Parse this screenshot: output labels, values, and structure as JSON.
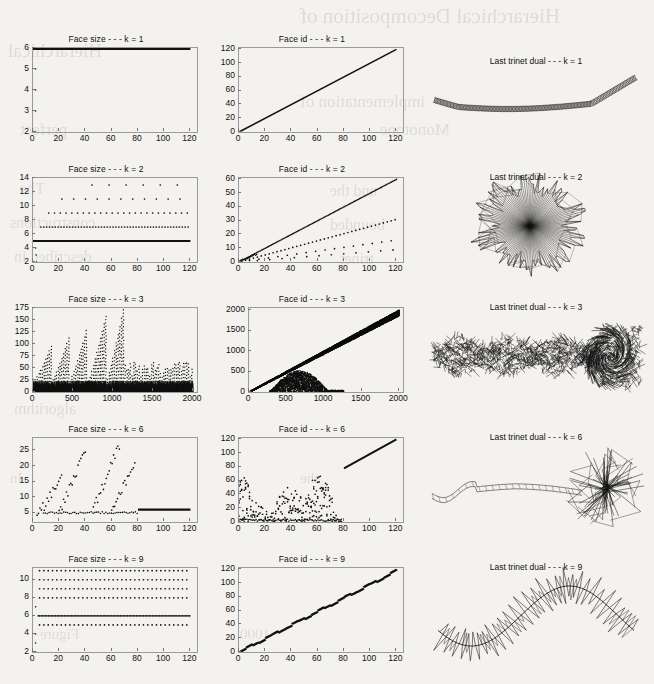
{
  "figure": {
    "background_color": "#f4f2ee",
    "ink_color": "#111111",
    "axis_color": "#9a9a9a"
  },
  "ghost_text": [
    {
      "text": "Hierarchical Decomposition of",
      "x": 300,
      "y": 4,
      "size": 21
    },
    {
      "text": "Hierarchical",
      "x": 8,
      "y": 40,
      "size": 19
    },
    {
      "text": "implementation of",
      "x": 300,
      "y": 92,
      "size": 17
    },
    {
      "text": "perfect",
      "x": 20,
      "y": 120,
      "size": 17
    },
    {
      "text": "Monotone",
      "x": 380,
      "y": 120,
      "size": 17
    },
    {
      "text": "The",
      "x": 20,
      "y": 180,
      "size": 16
    },
    {
      "text": "and the",
      "x": 330,
      "y": 182,
      "size": 16
    },
    {
      "text": "constructions",
      "x": 10,
      "y": 214,
      "size": 16
    },
    {
      "text": "bounded",
      "x": 330,
      "y": 216,
      "size": 16
    },
    {
      "text": "described in",
      "x": 14,
      "y": 248,
      "size": 16
    },
    {
      "text": "trinet",
      "x": 340,
      "y": 250,
      "size": 16
    },
    {
      "text": "algorithm",
      "x": 14,
      "y": 400,
      "size": 16
    },
    {
      "text": "In",
      "x": 10,
      "y": 470,
      "size": 15
    },
    {
      "text": "the",
      "x": 300,
      "y": 470,
      "size": 15
    },
    {
      "text": "1000",
      "x": 240,
      "y": 626,
      "size": 15
    },
    {
      "text": "Figure",
      "x": 40,
      "y": 626,
      "size": 15
    }
  ],
  "panels": [
    {
      "row": 0,
      "k": 1,
      "face_size": {
        "title": "Face size - - - k = 1",
        "yticks": [
          2,
          3,
          4,
          5,
          6
        ],
        "xticks": [
          0,
          20,
          40,
          60,
          80,
          100,
          120
        ],
        "ylim": [
          2,
          6
        ],
        "xlim": [
          0,
          125
        ],
        "ylabel": "",
        "xlabel": ""
      },
      "face_id": {
        "title": "Face id - - - k = 1",
        "yticks": [
          0,
          20,
          40,
          60,
          80,
          100,
          120
        ],
        "xticks": [
          0,
          20,
          40,
          60,
          80,
          100,
          120
        ],
        "ylim": [
          0,
          122
        ],
        "xlim": [
          0,
          125
        ],
        "ylabel": "",
        "xlabel": ""
      },
      "mesh": {
        "title": "Last trinet dual - - - k = 1",
        "shape": "smooth-strand"
      }
    },
    {
      "row": 1,
      "k": 2,
      "face_size": {
        "title": "Face size - - - k = 2",
        "yticks": [
          2,
          4,
          6,
          8,
          10,
          12,
          14
        ],
        "xticks": [
          0,
          20,
          40,
          60,
          80,
          100,
          120
        ],
        "ylim": [
          2,
          14
        ],
        "xlim": [
          0,
          125
        ],
        "ylabel": "",
        "xlabel": ""
      },
      "face_id": {
        "title": "Face id - - - k = 2",
        "yticks": [
          0,
          10,
          20,
          30,
          40,
          50,
          60
        ],
        "xticks": [
          0,
          20,
          40,
          60,
          80,
          100,
          120
        ],
        "ylim": [
          0,
          61
        ],
        "xlim": [
          0,
          125
        ],
        "ylabel": "",
        "xlabel": ""
      },
      "mesh": {
        "title": "Last trinet dual - - - k = 2",
        "shape": "radial-burst"
      }
    },
    {
      "row": 2,
      "k": 3,
      "face_size": {
        "title": "Face size - - - k = 3",
        "yticks": [
          0,
          25,
          50,
          75,
          100,
          125,
          150,
          175
        ],
        "xticks": [
          0,
          500,
          1000,
          1500,
          2000
        ],
        "ylim": [
          0,
          175
        ],
        "xlim": [
          0,
          2050
        ],
        "ylabel": "",
        "xlabel": ""
      },
      "face_id": {
        "title": "Face id - - - k = 3",
        "yticks": [
          0,
          500,
          1000,
          1500,
          2000
        ],
        "xticks": [
          0,
          500,
          1000,
          1500,
          2000
        ],
        "ylim": [
          0,
          2050
        ],
        "xlim": [
          0,
          2050
        ],
        "ylabel": "",
        "xlabel": ""
      },
      "mesh": {
        "title": "Last trinet dual - - - k = 3",
        "shape": "dense-caterpillar"
      }
    },
    {
      "row": 3,
      "k": 6,
      "face_size": {
        "title": "Face size - - - k = 6",
        "yticks": [
          5,
          10,
          15,
          20,
          25
        ],
        "xticks": [
          0,
          20,
          40,
          60,
          80,
          100,
          120
        ],
        "ylim": [
          2,
          29
        ],
        "xlim": [
          0,
          125
        ],
        "ylabel": "",
        "xlabel": ""
      },
      "face_id": {
        "title": "Face id - - - k = 6",
        "yticks": [
          0,
          20,
          40,
          60,
          80,
          100,
          120
        ],
        "xticks": [
          0,
          20,
          40,
          60,
          80,
          100,
          120
        ],
        "ylim": [
          0,
          122
        ],
        "xlim": [
          0,
          125
        ],
        "ylabel": "",
        "xlabel": ""
      },
      "mesh": {
        "title": "Last trinet dual - - - k = 6",
        "shape": "tadpole-burst"
      }
    },
    {
      "row": 4,
      "k": 9,
      "face_size": {
        "title": "Face size - - - k = 9",
        "yticks": [
          2,
          4,
          6,
          8,
          10
        ],
        "xticks": [
          0,
          20,
          40,
          60,
          80,
          100,
          120
        ],
        "ylim": [
          2,
          11.3
        ],
        "xlim": [
          0,
          125
        ],
        "ylabel": "",
        "xlabel": ""
      },
      "face_id": {
        "title": "Face id - - - k = 9",
        "yticks": [
          0,
          20,
          40,
          60,
          80,
          100,
          120
        ],
        "xticks": [
          0,
          20,
          40,
          60,
          80,
          100,
          120
        ],
        "ylim": [
          0,
          122
        ],
        "xlim": [
          0,
          125
        ],
        "ylabel": "",
        "xlabel": ""
      },
      "mesh": {
        "title": "Last trinet dual - - - k = 9",
        "shape": "spiky-sine"
      }
    }
  ],
  "chart_data": [
    {
      "type": "scatter",
      "title": "Face size - - - k = 1",
      "xlabel": "",
      "ylabel": "",
      "xlim": [
        0,
        125
      ],
      "ylim": [
        2,
        6
      ],
      "xticks": [
        0,
        20,
        40,
        60,
        80,
        100,
        120
      ],
      "yticks": [
        2,
        3,
        4,
        5,
        6
      ],
      "grid": false,
      "legend": null,
      "note": "Dense horizontal band of points at y = 6 for x from 0 to 120; a short vertical column of isolated points near x = 2 at y = 2, 3, 4, 5.",
      "series": [
        {
          "name": "plateau",
          "x": [
            0,
            120
          ],
          "y": [
            6,
            6
          ]
        },
        {
          "name": "startup",
          "x": [
            2,
            2,
            2,
            2
          ],
          "y": [
            2,
            3,
            4,
            5
          ]
        }
      ]
    },
    {
      "type": "scatter",
      "title": "Face id - - - k = 1",
      "xlabel": "",
      "ylabel": "",
      "xlim": [
        0,
        125
      ],
      "ylim": [
        0,
        122
      ],
      "xticks": [
        0,
        20,
        40,
        60,
        80,
        100,
        120
      ],
      "yticks": [
        0,
        20,
        40,
        60,
        80,
        100,
        120
      ],
      "grid": false,
      "legend": null,
      "note": "Single straight diagonal line of points from (0,0) to (120,120); identity relation.",
      "series": [
        {
          "name": "identity",
          "x": [
            0,
            120
          ],
          "y": [
            0,
            120
          ]
        }
      ]
    },
    {
      "type": "scatter",
      "title": "Face size - - - k = 2",
      "xlabel": "",
      "ylabel": "",
      "xlim": [
        0,
        125
      ],
      "ylim": [
        2,
        14
      ],
      "xticks": [
        0,
        20,
        40,
        60,
        80,
        100,
        120
      ],
      "yticks": [
        2,
        4,
        6,
        8,
        10,
        12,
        14
      ],
      "grid": false,
      "legend": null,
      "note": "Solid line at y = 5; dotted rows at y = 7 and y = 9 spanning full x; sparser dots at y = 11 and y = 13; short startup column near x = 2 at y = 2..4.",
      "series": [
        {
          "name": "y=5 solid",
          "x": [
            0,
            120
          ],
          "y": [
            5,
            5
          ]
        },
        {
          "name": "y=7 dotted",
          "x": [
            6,
            120
          ],
          "y": [
            7,
            7
          ]
        },
        {
          "name": "y=9 dotted",
          "x": [
            12,
            120
          ],
          "y": [
            9,
            9
          ]
        },
        {
          "name": "y=11 sparse",
          "x": [
            22,
            120
          ],
          "y": [
            11,
            11
          ]
        },
        {
          "name": "y=13 sparse",
          "x": [
            45,
            120
          ],
          "y": [
            13,
            13
          ]
        }
      ]
    },
    {
      "type": "scatter",
      "title": "Face id - - - k = 2",
      "xlabel": "",
      "ylabel": "",
      "xlim": [
        0,
        125
      ],
      "ylim": [
        0,
        61
      ],
      "xticks": [
        0,
        20,
        40,
        60,
        80,
        100,
        120
      ],
      "yticks": [
        0,
        10,
        20,
        30,
        40,
        50,
        60
      ],
      "grid": false,
      "legend": null,
      "note": "Main dense diagonal of slope 0.5 from (0,0) to (120,60); secondary dotted ray of slope ~0.26; two fainter lower scatters of slope ~0.13 and ~0.08.",
      "series": [
        {
          "name": "ray-1",
          "x": [
            0,
            120
          ],
          "y": [
            0,
            60
          ]
        },
        {
          "name": "ray-2",
          "x": [
            0,
            120
          ],
          "y": [
            0,
            31
          ]
        },
        {
          "name": "ray-3",
          "x": [
            0,
            120
          ],
          "y": [
            0,
            16
          ]
        },
        {
          "name": "ray-4",
          "x": [
            0,
            120
          ],
          "y": [
            0,
            9
          ]
        }
      ]
    },
    {
      "type": "scatter",
      "title": "Face size - - - k = 3",
      "xlabel": "",
      "ylabel": "",
      "xlim": [
        0,
        2050
      ],
      "ylim": [
        0,
        175
      ],
      "xticks": [
        0,
        500,
        1000,
        1500,
        2000
      ],
      "yticks": [
        0,
        25,
        50,
        75,
        100,
        125,
        150,
        175
      ],
      "grid": false,
      "legend": null,
      "note": "Dense black mass below y = 25 across all x; repeating sawtooth spikes; a few tall ramps reaching 150-175 near x = 250-1150; spike envelope drops to ~60 after x = 1200.",
      "series": [
        {
          "name": "baseline-mass",
          "x": [
            0,
            2000
          ],
          "y": [
            0,
            25
          ]
        },
        {
          "name": "tall-ramps-peak",
          "x": [
            250,
            500,
            700,
            900,
            1100
          ],
          "y": [
            80,
            110,
            135,
            160,
            172
          ]
        },
        {
          "name": "late-spikes-peak",
          "x": [
            1200,
            1500,
            1800,
            2000
          ],
          "y": [
            58,
            58,
            60,
            58
          ]
        }
      ]
    },
    {
      "type": "scatter",
      "title": "Face id - - - k = 3",
      "xlabel": "",
      "ylabel": "",
      "xlim": [
        0,
        2050
      ],
      "ylim": [
        0,
        2050
      ],
      "xticks": [
        0,
        500,
        1000,
        1500,
        2000
      ],
      "yticks": [
        0,
        500,
        1000,
        1500,
        2000
      ],
      "grid": false,
      "legend": null,
      "note": "Thick jagged diagonal band from (0,0) to (2000,2000) widening at the top; a dense low cluster below y = 500 for x between 300 and 1250.",
      "series": [
        {
          "name": "main-diagonal",
          "x": [
            0,
            2000
          ],
          "y": [
            0,
            2000
          ]
        },
        {
          "name": "low-cluster",
          "x": [
            300,
            1250
          ],
          "y": [
            0,
            500
          ]
        }
      ]
    },
    {
      "type": "scatter",
      "title": "Face size - - - k = 6",
      "xlabel": "",
      "ylabel": "",
      "xlim": [
        0,
        125
      ],
      "ylim": [
        2,
        29
      ],
      "xticks": [
        0,
        20,
        40,
        60,
        80,
        100,
        120
      ],
      "yticks": [
        5,
        10,
        15,
        20,
        25
      ],
      "grid": false,
      "legend": null,
      "note": "Three rising scatter lobes peaking near x = 22 (y~16), x = 38 (y~24) and x = 65-75 (y~28); a flat band at y = 5 below them; solid horizontal line at y = 6 from x = 80 to 120.",
      "series": [
        {
          "name": "lobe-1",
          "x": [
            2,
            22
          ],
          "y": [
            3,
            16
          ]
        },
        {
          "name": "lobe-2",
          "x": [
            22,
            40
          ],
          "y": [
            5,
            25
          ]
        },
        {
          "name": "lobe-3",
          "x": [
            48,
            67
          ],
          "y": [
            6,
            29
          ]
        },
        {
          "name": "flat-tail",
          "x": [
            80,
            120
          ],
          "y": [
            6,
            6
          ]
        }
      ]
    },
    {
      "type": "scatter",
      "title": "Face id - - - k = 6",
      "xlabel": "",
      "ylabel": "",
      "xlim": [
        0,
        125
      ],
      "ylim": [
        0,
        122
      ],
      "xticks": [
        0,
        20,
        40,
        60,
        80,
        100,
        120
      ],
      "yticks": [
        0,
        20,
        40,
        60,
        80,
        100,
        120
      ],
      "grid": false,
      "legend": null,
      "note": "Sparse low scatter for x < 78 with rising lobes peaking near y = 70; straight solid diagonal from (80,78) to (120,120).",
      "series": [
        {
          "name": "scatter-lobes",
          "x": [
            0,
            78
          ],
          "y": [
            0,
            70
          ]
        },
        {
          "name": "solid-diagonal",
          "x": [
            80,
            120
          ],
          "y": [
            78,
            120
          ]
        }
      ]
    },
    {
      "type": "scatter",
      "title": "Face size - - - k = 9",
      "xlabel": "",
      "ylabel": "",
      "xlim": [
        0,
        125
      ],
      "ylim": [
        2,
        11.3
      ],
      "xticks": [
        0,
        20,
        40,
        60,
        80,
        100,
        120
      ],
      "yticks": [
        2,
        4,
        6,
        8,
        10
      ],
      "grid": false,
      "legend": null,
      "note": "Evenly spaced dotted rows at y = 5, 6 (denser), 7, 8, 9, 10, 11 spanning x = 4 to 120; a startup column near x = 2 at y = 2, 3, 4, 6.",
      "series": [
        {
          "name": "row-11",
          "x": [
            5,
            120
          ],
          "y": [
            11,
            11
          ]
        },
        {
          "name": "row-10",
          "x": [
            5,
            120
          ],
          "y": [
            10,
            10
          ]
        },
        {
          "name": "row-9",
          "x": [
            5,
            120
          ],
          "y": [
            9,
            9
          ]
        },
        {
          "name": "row-8",
          "x": [
            5,
            120
          ],
          "y": [
            8,
            8
          ]
        },
        {
          "name": "row-6-dense",
          "x": [
            4,
            120
          ],
          "y": [
            6,
            6
          ]
        },
        {
          "name": "row-5",
          "x": [
            5,
            120
          ],
          "y": [
            5,
            5
          ]
        },
        {
          "name": "startup",
          "x": [
            2,
            2,
            2,
            2
          ],
          "y": [
            2,
            3,
            4,
            7
          ]
        }
      ]
    },
    {
      "type": "scatter",
      "title": "Face id - - - k = 9",
      "xlabel": "",
      "ylabel": "",
      "xlim": [
        0,
        125
      ],
      "ylim": [
        0,
        122
      ],
      "xticks": [
        0,
        20,
        40,
        60,
        80,
        100,
        120
      ],
      "yticks": [
        0,
        20,
        40,
        60,
        80,
        100,
        120
      ],
      "grid": false,
      "legend": null,
      "note": "Stair-stepped diagonal band of points from (0,0) to (120,118); small horizontal plateaus give a staircase texture.",
      "series": [
        {
          "name": "staircase-diagonal",
          "x": [
            0,
            120
          ],
          "y": [
            0,
            118
          ]
        }
      ]
    }
  ]
}
